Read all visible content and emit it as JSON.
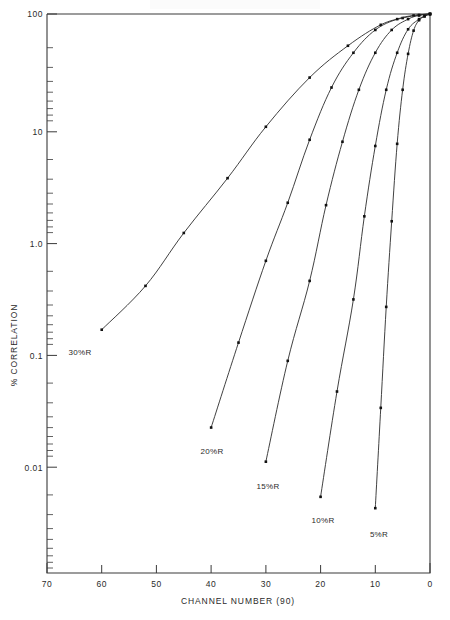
{
  "chart_data": {
    "type": "line",
    "title": "",
    "xlabel": "CHANNEL NUMBER (90)",
    "ylabel": "% CORRELATION",
    "xlim": [
      70,
      0
    ],
    "ylim": [
      0.001,
      100
    ],
    "x_reversed": true,
    "y_scale": "log",
    "grid": false,
    "legend_position": "inline-curve-end-labels",
    "xticks": [
      70,
      60,
      50,
      40,
      30,
      20,
      10,
      0
    ],
    "xtick_labels": [
      "70",
      "60",
      "50",
      "40",
      "30",
      "20",
      "10",
      "0"
    ],
    "yticks": [
      100,
      10,
      1.0,
      0.1,
      0.01
    ],
    "ytick_labels": [
      "100",
      "10",
      "1.0",
      "0.1",
      "0.01"
    ],
    "marker": "square",
    "series": [
      {
        "name": "30%R",
        "label": "30%R",
        "x": [
          60,
          52,
          45,
          37,
          30,
          22,
          15,
          9,
          5,
          2,
          0
        ],
        "y": [
          0.15,
          0.37,
          1.1,
          3.4,
          9.8,
          27,
          52,
          80,
          92,
          98,
          100
        ]
      },
      {
        "name": "20%R",
        "label": "20%R",
        "x": [
          40,
          35,
          30,
          26,
          22,
          18,
          14,
          10,
          6,
          3,
          0
        ],
        "y": [
          0.02,
          0.115,
          0.62,
          2.05,
          7.5,
          22,
          45,
          72,
          90,
          97,
          100
        ]
      },
      {
        "name": "15%R",
        "label": "15%R",
        "x": [
          30,
          26,
          22,
          19,
          16,
          13,
          10,
          7,
          4,
          2,
          0
        ],
        "y": [
          0.0099,
          0.079,
          0.41,
          1.95,
          7.2,
          21,
          45,
          72,
          90,
          97,
          100
        ]
      },
      {
        "name": "10%R",
        "label": "10%R",
        "x": [
          20,
          17,
          14,
          12,
          10,
          8,
          6,
          4,
          2,
          1,
          0
        ],
        "y": [
          0.0048,
          0.042,
          0.28,
          1.55,
          6.6,
          21,
          45,
          73,
          90,
          96,
          100
        ]
      },
      {
        "name": "5%R",
        "label": "5%R",
        "x": [
          10,
          9,
          8,
          7,
          6,
          5,
          4,
          3,
          2,
          1,
          0
        ],
        "y": [
          0.0038,
          0.03,
          0.24,
          1.4,
          6.9,
          21,
          44,
          71,
          88,
          95,
          100
        ]
      }
    ]
  },
  "axes": {
    "x_axis_label": "CHANNEL NUMBER (90)",
    "y_axis_label": "% CORRELATION"
  },
  "labels": {
    "x0": "70",
    "x1": "60",
    "x2": "50",
    "x3": "40",
    "x4": "30",
    "x5": "20",
    "x6": "10",
    "x7": "0",
    "y0": "100",
    "y1": "10",
    "y2": "1.0",
    "y3": "0.1",
    "y4": "0.01",
    "s0": "30%R",
    "s1": "20%R",
    "s2": "15%R",
    "s3": "10%R",
    "s4": "5%R"
  }
}
